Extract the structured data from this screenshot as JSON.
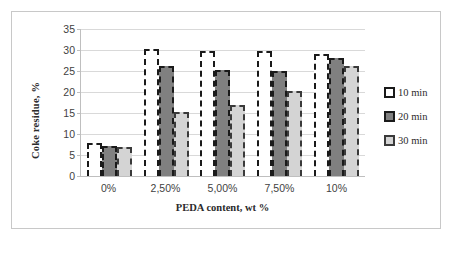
{
  "chart_data": {
    "type": "bar",
    "title": "",
    "xlabel": "PEDA content, wt %",
    "ylabel": "Coke residue, %",
    "categories": [
      "0%",
      "2,50%",
      "5,00%",
      "7,50%",
      "10%"
    ],
    "series": [
      {
        "name": "10 min",
        "values": [
          7.8,
          30.2,
          29.8,
          29.7,
          29.0
        ],
        "color": "#ffffff",
        "outline": "#1a1a1a",
        "pattern": "dashed-outline"
      },
      {
        "name": "20 min",
        "values": [
          7.2,
          26.3,
          25.3,
          25.1,
          28.0
        ],
        "color": "#808080",
        "outline": "#1a1a1a",
        "pattern": "solid-dark-gray"
      },
      {
        "name": "30 min",
        "values": [
          7.0,
          15.2,
          17.0,
          20.2,
          26.2
        ],
        "color": "#d4d4d4",
        "outline": "#3a3a3a",
        "pattern": "solid-light-gray"
      }
    ],
    "ylim": [
      0,
      35
    ],
    "yticks": [
      0,
      5,
      10,
      15,
      20,
      25,
      30,
      35
    ],
    "ytick_labels": [
      "0",
      "5",
      "10",
      "15",
      "20",
      "25",
      "30",
      "35"
    ],
    "grid": "horizontal",
    "legend_position": "right",
    "legend_entries": [
      "10 min",
      "20 min",
      "30 min"
    ]
  },
  "figure": {
    "border_color": "#c8c8c8",
    "background": "#ffffff"
  }
}
